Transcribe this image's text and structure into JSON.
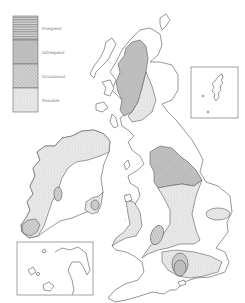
{
  "map": {
    "region": "British Isles",
    "legend": {
      "items": [
        {
          "key": "frequent",
          "label": "Frequent",
          "pattern": "horizontal-hatch",
          "color": "#b9b9b9"
        },
        {
          "key": "infrequent",
          "label": "Infrequent",
          "pattern": "dense-diagonal-hatch",
          "color": "#c6c6c6"
        },
        {
          "key": "occasional",
          "label": "Occasional",
          "pattern": "diagonal-hatch",
          "color": "#cdcdcd"
        },
        {
          "key": "possible",
          "label": "Possible",
          "pattern": "stipple",
          "color": "#e0e0e0"
        }
      ]
    },
    "insets": [
      {
        "name": "shetland-inset",
        "label": ""
      },
      {
        "name": "channel-islands-inset",
        "label": ""
      }
    ],
    "colors": {
      "coastline": "#6b6b6b",
      "land": "#ffffff",
      "background": "#ffffff"
    }
  }
}
